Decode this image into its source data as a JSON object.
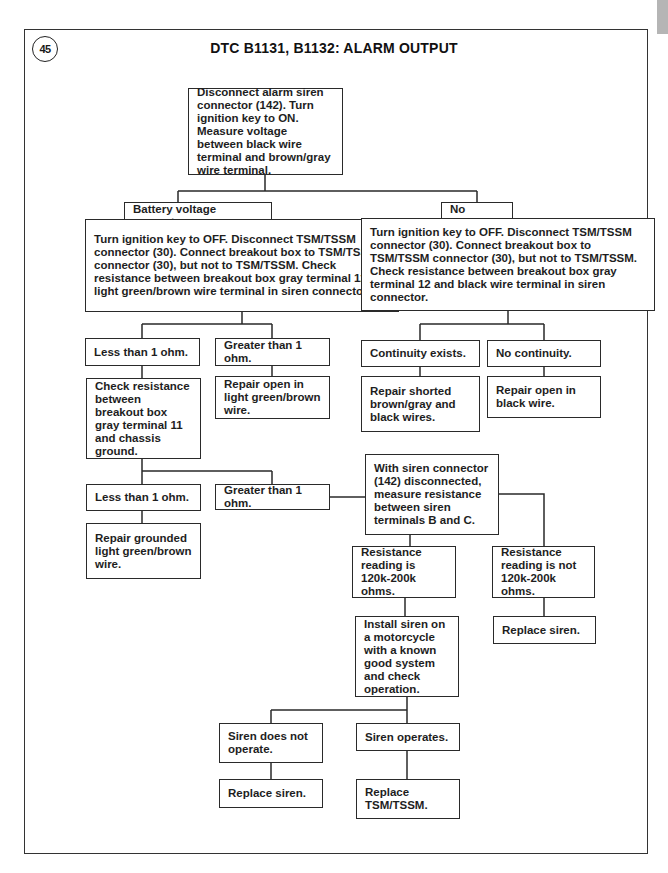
{
  "page": {
    "badge": "45",
    "title": "DTC B1131, B1132: ALARM OUTPUT"
  },
  "nodes": [
    {
      "id": "start",
      "x": 188,
      "y": 88,
      "w": 155,
      "h": 87,
      "text": "Disconnect alarm siren connector (142). Turn ignition key to ON. Measure voltage between black wire terminal and brown/gray wire terminal."
    },
    {
      "id": "battery_present",
      "x": 124,
      "y": 202,
      "w": 148,
      "h": 27,
      "text": "Battery voltage present."
    },
    {
      "id": "no_voltage",
      "x": 441,
      "y": 202,
      "w": 72,
      "h": 27,
      "text": "No voltage."
    },
    {
      "id": "left_check",
      "x": 85,
      "y": 219,
      "w": 314,
      "h": 93,
      "text": "Turn ignition key to OFF. Disconnect TSM/TSSM connector (30). Connect breakout box to TSM/TSSM connector (30), but not to TSM/TSSM. Check resistance between breakout box gray terminal 11 and light green/brown wire terminal in siren connector."
    },
    {
      "id": "right_check",
      "x": 361,
      "y": 218,
      "w": 294,
      "h": 93,
      "text": "Turn ignition key to OFF. Disconnect TSM/TSSM connector (30). Connect breakout box to TSM/TSSM connector (30), but not to TSM/TSSM. Check resistance between breakout box gray terminal 12 and black wire terminal in siren connector."
    },
    {
      "id": "l_less1",
      "x": 85,
      "y": 338,
      "w": 115,
      "h": 28,
      "text": "Less than 1 ohm."
    },
    {
      "id": "l_greater1",
      "x": 215,
      "y": 338,
      "w": 115,
      "h": 28,
      "text": "Greater than 1 ohm."
    },
    {
      "id": "continuity",
      "x": 361,
      "y": 340,
      "w": 119,
      "h": 27,
      "text": "Continuity exists."
    },
    {
      "id": "no_continuity",
      "x": 487,
      "y": 340,
      "w": 114,
      "h": 27,
      "text": "No continuity."
    },
    {
      "id": "check_chassis",
      "x": 86,
      "y": 378,
      "w": 115,
      "h": 81,
      "text": "Check resistance between breakout box gray terminal 11 and chassis ground."
    },
    {
      "id": "repair_open_lgb",
      "x": 215,
      "y": 376,
      "w": 115,
      "h": 43,
      "text": "Repair open in light green/brown wire."
    },
    {
      "id": "repair_shorted",
      "x": 361,
      "y": 376,
      "w": 119,
      "h": 56,
      "text": "Repair shorted brown/gray and black wires."
    },
    {
      "id": "repair_open_black",
      "x": 487,
      "y": 376,
      "w": 114,
      "h": 42,
      "text": "Repair open in black wire."
    },
    {
      "id": "c_less1",
      "x": 86,
      "y": 484,
      "w": 115,
      "h": 27,
      "text": "Less than 1 ohm."
    },
    {
      "id": "c_greater1",
      "x": 215,
      "y": 484,
      "w": 115,
      "h": 26,
      "text": "Greater than 1 ohm."
    },
    {
      "id": "siren_measure",
      "x": 365,
      "y": 454,
      "w": 134,
      "h": 81,
      "text": "With siren connector (142) disconnected, measure resistance between siren terminals B and C."
    },
    {
      "id": "repair_grounded",
      "x": 86,
      "y": 523,
      "w": 115,
      "h": 56,
      "text": "Repair grounded light green/brown wire."
    },
    {
      "id": "res_in_range",
      "x": 352,
      "y": 546,
      "w": 104,
      "h": 52,
      "text": "Resistance reading is 120k-200k ohms."
    },
    {
      "id": "res_out_range",
      "x": 492,
      "y": 546,
      "w": 103,
      "h": 52,
      "text": "Resistance reading is not 120k-200k ohms."
    },
    {
      "id": "replace_siren_r",
      "x": 493,
      "y": 616,
      "w": 103,
      "h": 28,
      "text": "Replace siren."
    },
    {
      "id": "install_test",
      "x": 355,
      "y": 616,
      "w": 104,
      "h": 81,
      "text": "Install siren on a motorcycle with a known good system and check operation."
    },
    {
      "id": "siren_no_op",
      "x": 219,
      "y": 723,
      "w": 104,
      "h": 40,
      "text": "Siren does not operate."
    },
    {
      "id": "siren_op",
      "x": 356,
      "y": 723,
      "w": 104,
      "h": 28,
      "text": "Siren operates."
    },
    {
      "id": "replace_siren_b",
      "x": 219,
      "y": 779,
      "w": 104,
      "h": 29,
      "text": "Replace siren."
    },
    {
      "id": "replace_tsm",
      "x": 356,
      "y": 779,
      "w": 104,
      "h": 40,
      "text": "Replace TSM/TSSM."
    }
  ],
  "connectors": [
    "M265 175 V191 M178 191 H477 M178 191 V202 M477 191 V202",
    "M178 229 V219",
    "M477 229 V218",
    "M242 312 V324 M142 324 H272 M142 324 V338 M272 324 V338",
    "M142 366 V378",
    "M272 366 V376",
    "M508 311 V324 M420 324 H544 M420 324 V340 M544 324 V340",
    "M420 367 V376",
    "M544 367 V376",
    "M142 459 V471 M142 471 H272 M142 471 V484 M272 471 V484",
    "M142 511 V523",
    "M330 497 H365",
    "M410 535 V546",
    "M499 494 H544 V546",
    "M544 598 V616",
    "M405 598 V616",
    "M407 697 V710 M271 710 H407 M271 710 V723 M407 710 V723",
    "M271 763 V779",
    "M407 751 V779"
  ],
  "colors": {
    "stroke": "#2a2a2a",
    "tab": "#b5b5b5"
  }
}
